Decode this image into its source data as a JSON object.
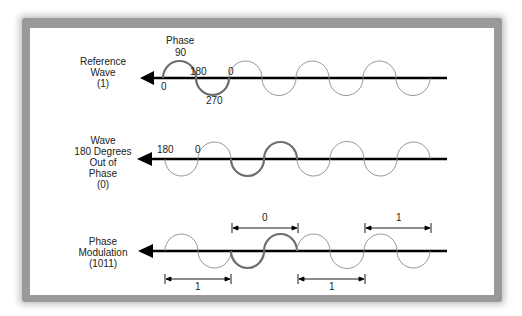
{
  "colors": {
    "axis": "#000000",
    "wave_thin": "#8a8a8a",
    "wave_highlight": "#6e6e6e",
    "frame": "#9a9a9a",
    "background": "#ffffff"
  },
  "rows": [
    {
      "id": "reference-wave",
      "label": "Reference\nWave\n(1)",
      "phase_title": "Phase",
      "phase_labels": {
        "p0_start": "0",
        "p90": "90",
        "p180": "180",
        "p270": "270",
        "p0_end": "0"
      }
    },
    {
      "id": "wave-180-out-of-phase",
      "label": "Wave\n180 Degrees\nOut of\nPhase\n(0)",
      "phase_labels": {
        "p180": "180",
        "p0": "0"
      }
    },
    {
      "id": "phase-modulation",
      "label": "Phase\nModulation\n(1011)",
      "bits": [
        {
          "value": "1",
          "position": "below"
        },
        {
          "value": "0",
          "position": "above"
        },
        {
          "value": "1",
          "position": "below"
        },
        {
          "value": "1",
          "position": "above"
        }
      ]
    }
  ]
}
